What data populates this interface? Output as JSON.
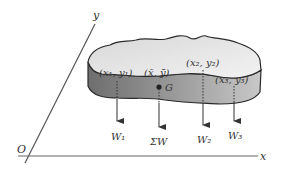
{
  "diagram": {
    "type": "center-of-gravity-plate",
    "axes": {
      "origin_label": "O",
      "x_label": "x",
      "y_label": "y"
    },
    "points": [
      {
        "id": "p1",
        "label": "(x₁, y₁)",
        "x": "x₁",
        "y": "y₁",
        "weight_label": "W₁"
      },
      {
        "id": "centroid",
        "label": "(x̄, ȳ)",
        "x": "x̄",
        "y": "ȳ",
        "point_label": "G",
        "weight_label": "ΣW"
      },
      {
        "id": "p2",
        "label": "(x₂, y₂)",
        "x": "x₂",
        "y": "y₂",
        "weight_label": "W₂"
      },
      {
        "id": "p3",
        "label": "(x₃, y₃)",
        "x": "x₃",
        "y": "y₃",
        "weight_label": "W₃"
      }
    ],
    "colors": {
      "plate_top": "#e6e6e6",
      "plate_side": "#8c8c8c",
      "outline": "#2a2a2a",
      "axis": "#555555",
      "text": "#333333"
    }
  }
}
